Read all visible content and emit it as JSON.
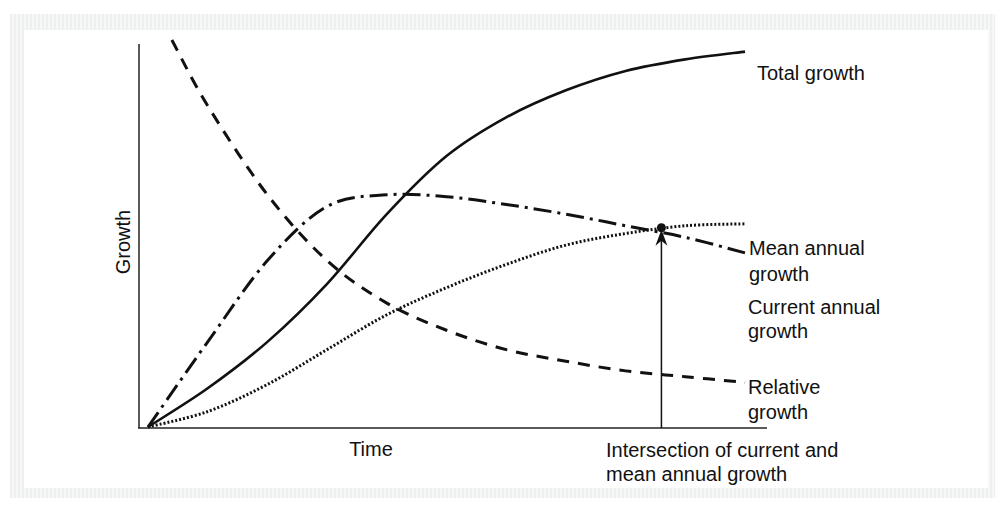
{
  "chart_data": {
    "type": "line",
    "title": "",
    "xlabel": "Time",
    "ylabel": "Growth",
    "xlim": [
      0,
      1
    ],
    "ylim": [
      0,
      1
    ],
    "grid": false,
    "legend": "inline labels at right end of each curve",
    "series": [
      {
        "name": "Total growth",
        "style": "solid",
        "x": [
          0,
          0.1,
          0.2,
          0.3,
          0.4,
          0.5,
          0.6,
          0.7,
          0.8,
          0.9,
          1.0
        ],
        "values": [
          0,
          0.1,
          0.22,
          0.37,
          0.55,
          0.7,
          0.8,
          0.87,
          0.92,
          0.95,
          0.97
        ]
      },
      {
        "name": "Current annual growth",
        "style": "dash-dot",
        "x": [
          0,
          0.1,
          0.2,
          0.3,
          0.4,
          0.5,
          0.6,
          0.7,
          0.8,
          0.9,
          1.0
        ],
        "values": [
          0,
          0.22,
          0.43,
          0.57,
          0.6,
          0.595,
          0.575,
          0.55,
          0.52,
          0.49,
          0.45
        ]
      },
      {
        "name": "Mean annual growth",
        "style": "dotted",
        "x": [
          0,
          0.1,
          0.2,
          0.3,
          0.4,
          0.5,
          0.6,
          0.7,
          0.8,
          0.9,
          1.0
        ],
        "values": [
          0,
          0.04,
          0.11,
          0.2,
          0.29,
          0.36,
          0.42,
          0.47,
          0.5,
          0.52,
          0.525
        ]
      },
      {
        "name": "Relative growth",
        "style": "dashed",
        "x": [
          0.04,
          0.1,
          0.2,
          0.3,
          0.4,
          0.5,
          0.6,
          0.7,
          0.8,
          0.9,
          1.0
        ],
        "values": [
          1.0,
          0.83,
          0.6,
          0.43,
          0.32,
          0.25,
          0.2,
          0.17,
          0.145,
          0.13,
          0.115
        ]
      }
    ],
    "annotations": [
      {
        "text": "Intersection of current and mean annual growth",
        "lines": [
          "Intersection of current and",
          "mean annual growth"
        ],
        "x": 0.86,
        "y": 0.515,
        "marker": "dot with arrow from x-axis"
      }
    ],
    "curve_labels": {
      "total": "Total growth",
      "mean": [
        "Mean annual",
        "growth"
      ],
      "current": [
        "Current annual",
        "growth"
      ],
      "relative": [
        "Relative",
        "growth"
      ]
    }
  },
  "colors": {
    "ink": "#111111",
    "background": "#ffffff",
    "frame": "#eef0f0"
  }
}
